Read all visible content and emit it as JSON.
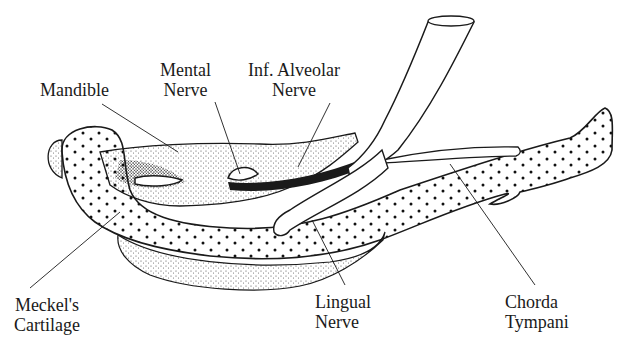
{
  "figure": {
    "labels": {
      "mandible": {
        "lines": [
          "Mandible"
        ]
      },
      "mental_nerve": {
        "lines": [
          "Mental",
          "Nerve"
        ]
      },
      "inf_alveolar_nerve": {
        "lines": [
          "Inf. Alveolar",
          "Nerve"
        ]
      },
      "meckels_cartilage": {
        "lines": [
          "Meckel's",
          "Cartilage"
        ]
      },
      "lingual_nerve": {
        "lines": [
          "Lingual",
          "Nerve"
        ]
      },
      "chorda_tympani": {
        "lines": [
          "Chorda",
          "Tympani"
        ]
      }
    },
    "colors": {
      "ink": "#1a1a1a",
      "background": "#ffffff",
      "stipple": "#555555"
    }
  }
}
